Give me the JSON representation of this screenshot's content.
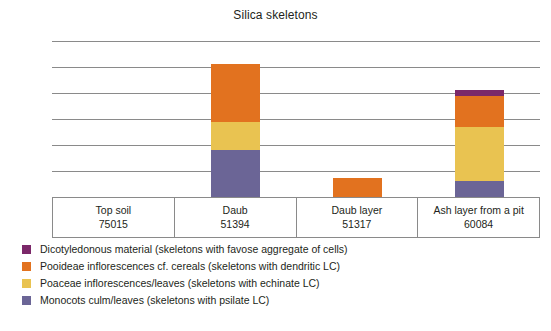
{
  "chart_data": {
    "type": "bar",
    "subtype": "stacked-bar",
    "title": "Silica skeletons",
    "xlabel": "",
    "ylabel": "",
    "yunit": "%",
    "ylim": [
      0,
      3
    ],
    "yticks": [
      0,
      0.5,
      1,
      1.5,
      2,
      2.5,
      3
    ],
    "ytick_labels": [
      "0",
      "0.5",
      "1",
      "1.5",
      "2",
      "2.5",
      "3 %"
    ],
    "grid": true,
    "legend_position": "below",
    "categories": [
      "Top soil",
      "Daub",
      "Daub layer",
      "Ash layer from a pit"
    ],
    "category_codes": [
      "75015",
      "51394",
      "51317",
      "60084"
    ],
    "series": [
      {
        "name": "Monocots culm/leaves (skeletons with psilate LC)",
        "color": "#6b6596",
        "values": [
          0,
          0.9,
          0,
          0.3
        ]
      },
      {
        "name": "Poaceae inflorescences/leaves (skeletons with echinate LC)",
        "color": "#e9c351",
        "values": [
          0,
          0.55,
          0,
          1.05
        ]
      },
      {
        "name": "Pooideae inflorescences cf. cereals (skeletons with dendritic LC)",
        "color": "#e2721f",
        "values": [
          0,
          1.1,
          0.37,
          0.6
        ]
      },
      {
        "name": "Dicotyledonous material (skeletons with favose aggregate of cells)",
        "color": "#7b2869",
        "values": [
          0,
          0,
          0,
          0.1
        ]
      }
    ],
    "totals": [
      0,
      2.55,
      0.37,
      2.05
    ]
  },
  "legend": {
    "items": [
      {
        "label": "Dicotyledonous material (skeletons with favose aggregate of cells)",
        "color": "#7b2869"
      },
      {
        "label": "Pooideae inflorescences cf. cereals (skeletons with dendritic LC)",
        "color": "#e2721f"
      },
      {
        "label": "Poaceae inflorescences/leaves (skeletons with echinate LC)",
        "color": "#e9c351"
      },
      {
        "label": "Monocots culm/leaves (skeletons with psilate LC)",
        "color": "#6b6596"
      }
    ]
  },
  "colors": {
    "grid": "#8a8a8a",
    "text": "#231f20",
    "background": "#ffffff"
  }
}
